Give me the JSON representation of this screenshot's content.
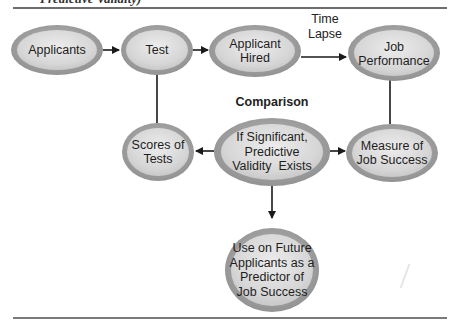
{
  "caption": "Predictive Validity)",
  "diagram": {
    "title_labels": {
      "comparison": "Comparison",
      "time_lapse": [
        "Time",
        "Lapse"
      ]
    },
    "nodes": [
      {
        "id": "applicants",
        "lines": [
          "Applicants"
        ]
      },
      {
        "id": "test",
        "lines": [
          "Test"
        ]
      },
      {
        "id": "applicant-hired",
        "lines": [
          "Applicant",
          "Hired"
        ]
      },
      {
        "id": "job-performance",
        "lines": [
          "Job",
          "Performance"
        ]
      },
      {
        "id": "scores-of-tests",
        "lines": [
          "Scores of",
          "Tests"
        ]
      },
      {
        "id": "predictive-validity",
        "lines": [
          "If Significant,",
          "Predictive",
          "Validity  Exists"
        ]
      },
      {
        "id": "measure-of-job-success",
        "lines": [
          "Measure of",
          "Job Success"
        ]
      },
      {
        "id": "use-on-future",
        "lines": [
          "Use on Future",
          "Applicants as a",
          "Predictor of",
          "Job Success"
        ]
      }
    ],
    "edges": [
      {
        "from": "applicants",
        "to": "test",
        "type": "arrow"
      },
      {
        "from": "test",
        "to": "applicant-hired",
        "type": "arrow"
      },
      {
        "from": "applicant-hired",
        "to": "job-performance",
        "type": "arrow",
        "label": "Time Lapse"
      },
      {
        "from": "test",
        "to": "scores-of-tests",
        "type": "line"
      },
      {
        "from": "job-performance",
        "to": "measure-of-job-success",
        "type": "line"
      },
      {
        "from": "predictive-validity",
        "to": "scores-of-tests",
        "type": "arrow"
      },
      {
        "from": "predictive-validity",
        "to": "measure-of-job-success",
        "type": "arrow"
      },
      {
        "from": "predictive-validity",
        "to": "use-on-future",
        "type": "arrow"
      }
    ],
    "colors": {
      "ellipse_outer": "#9a9a9a",
      "ellipse_inner": "#dcdcdc",
      "line": "#1a1a1a",
      "rule": "#6d6d6d"
    }
  }
}
